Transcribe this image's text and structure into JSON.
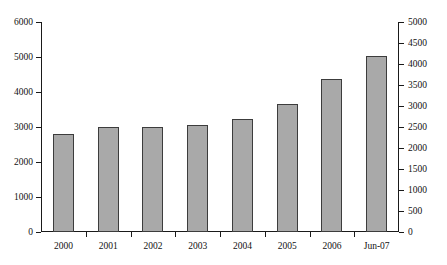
{
  "chart_data": {
    "type": "bar",
    "title": "",
    "subtitle": "",
    "xlabel": "",
    "ylabel": "",
    "y2label": "",
    "grid": false,
    "legend": "none",
    "categories": [
      "2000",
      "2001",
      "2002",
      "2003",
      "2004",
      "2005",
      "2006",
      "Jun-07"
    ],
    "values": [
      2800,
      3000,
      3010,
      3050,
      3220,
      3650,
      4370,
      5030
    ],
    "ylim": [
      0,
      6000
    ],
    "y2lim": [
      0,
      5000
    ],
    "yticks": [
      "0",
      "1000",
      "2000",
      "3000",
      "4000",
      "5000",
      "6000"
    ],
    "ytick_values": [
      0,
      1000,
      2000,
      3000,
      4000,
      5000,
      6000
    ],
    "y2ticks": [
      "0",
      "500",
      "1000",
      "1500",
      "2000",
      "2500",
      "3000",
      "3500",
      "4000",
      "4500",
      "5000"
    ],
    "y2tick_values": [
      0,
      500,
      1000,
      1500,
      2000,
      2500,
      3000,
      3500,
      4000,
      4500,
      5000
    ],
    "series": [
      {
        "name": "",
        "values": [
          2800,
          3000,
          3010,
          3050,
          3220,
          3650,
          4370,
          5030
        ]
      }
    ],
    "colors": {
      "bar_fill": "#a9a9a9",
      "bar_border": "#3c3c3c",
      "axis": "#1a1a1a",
      "text": "#111111",
      "background": "#ffffff"
    }
  }
}
